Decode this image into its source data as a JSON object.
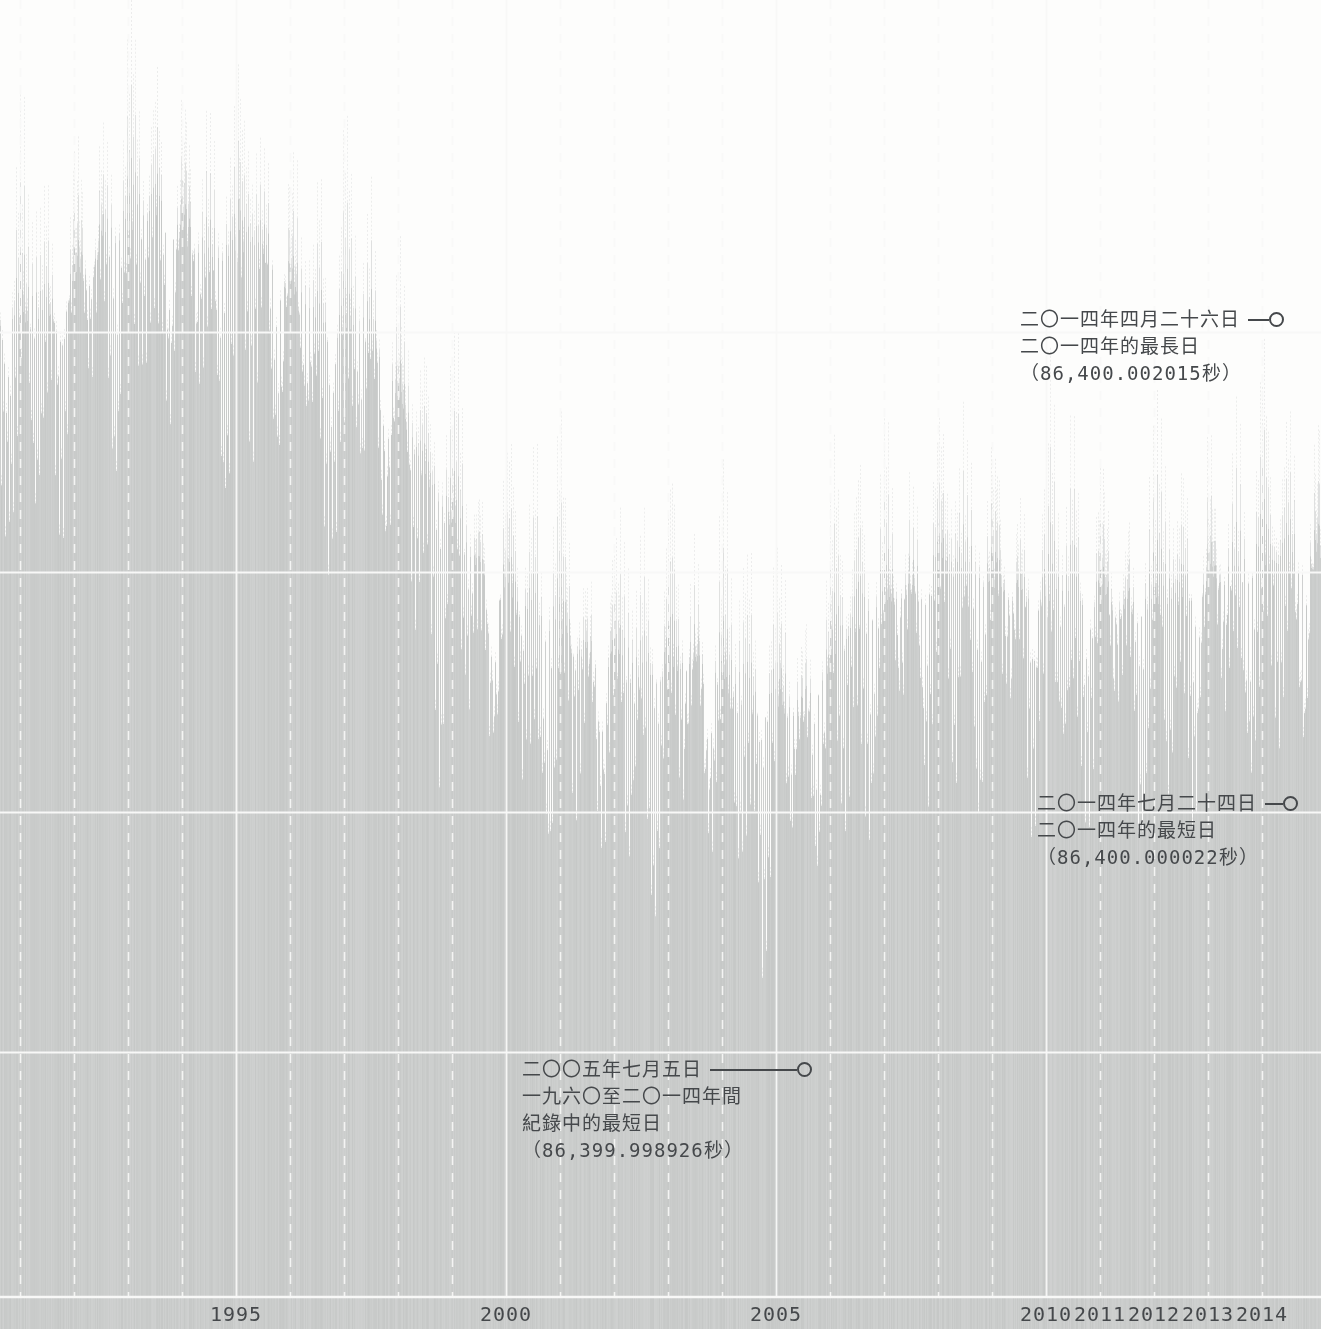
{
  "figure": {
    "background_color": "#fdfdfc",
    "area_color": "#c9cbca",
    "grid_color": "#f8f8f7",
    "ink_color": "#45484b"
  },
  "chart_data": {
    "type": "bar",
    "title": "",
    "x_axis": {
      "range_years": [
        1990.7,
        2015.1
      ],
      "labels": [
        {
          "text": "1995",
          "year": 1995
        },
        {
          "text": "2000",
          "year": 2000
        },
        {
          "text": "2005",
          "year": 2005
        },
        {
          "text": "2010",
          "year": 2010
        },
        {
          "text": "2011",
          "year": 2011
        },
        {
          "text": "2012",
          "year": 2012
        },
        {
          "text": "2013",
          "year": 2013
        },
        {
          "text": "2014",
          "year": 2014
        }
      ],
      "solid_gridline_years": [
        1995,
        2000,
        2005,
        2010
      ],
      "dashed_gridline_years": [
        1991,
        1992,
        1993,
        1994,
        1996,
        1997,
        1998,
        1999,
        2001,
        2002,
        2003,
        2004,
        2006,
        2007,
        2008,
        2009,
        2011,
        2012,
        2013,
        2014
      ]
    },
    "y_axis": {
      "unit": "seconds",
      "gridline_values_seconds": [
        86400.002,
        86400.001,
        86400.0,
        86399.999
      ],
      "baseline_seconds": 86399.998
    },
    "annual_mean_day_length_excess_ms": [
      [
        1991,
        2.0
      ],
      [
        1992,
        2.3
      ],
      [
        1993,
        2.45
      ],
      [
        1994,
        2.25
      ],
      [
        1995,
        2.3
      ],
      [
        1996,
        1.95
      ],
      [
        1997,
        1.95
      ],
      [
        1998,
        1.35
      ],
      [
        1999,
        0.95
      ],
      [
        2000,
        0.75
      ],
      [
        2001,
        0.6
      ],
      [
        2002,
        0.5
      ],
      [
        2003,
        0.6
      ],
      [
        2004,
        0.4
      ],
      [
        2005,
        0.38
      ],
      [
        2006,
        0.75
      ],
      [
        2007,
        0.9
      ],
      [
        2008,
        0.95
      ],
      [
        2009,
        0.85
      ],
      [
        2010,
        0.85
      ],
      [
        2011,
        0.8
      ],
      [
        2012,
        0.85
      ],
      [
        2013,
        0.95
      ],
      [
        2014,
        1.0
      ]
    ],
    "oscillation_ms": {
      "semiannual": 0.33,
      "annual": 0.18,
      "fortnightly": 0.36,
      "fortnightly_modulation": 0.12,
      "monthly": 0.2,
      "noise": 0.1
    },
    "annotations": [
      {
        "date": "二〇一四年四月二十六日",
        "desc": "二〇一四年的最長日",
        "value": "（86,400.002015秒）",
        "seconds": 86400.002015,
        "year_fraction": 2014.32
      },
      {
        "date": "二〇一四年七月二十四日",
        "desc": "二〇一四年的最短日",
        "value": "（86,400.000022秒）",
        "seconds": 86400.000022,
        "year_fraction": 2014.56
      },
      {
        "date": "二〇〇五年七月五日",
        "desc": "一九六〇至二〇一四年間",
        "desc2": "紀錄中的最短日",
        "value": "（86,399.998926秒）",
        "seconds": 86399.998926,
        "year_fraction": 2005.51
      }
    ]
  }
}
